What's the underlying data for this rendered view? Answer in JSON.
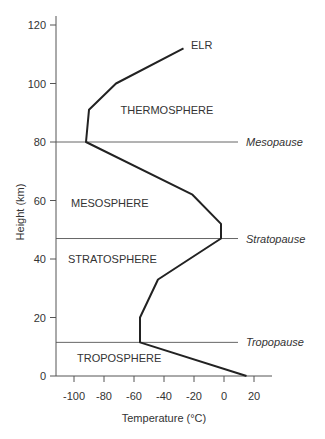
{
  "chart_data": {
    "type": "line",
    "title": "",
    "xlabel": "Temperature (°C)",
    "ylabel": "Height (km)",
    "xlim": [
      -115,
      32
    ],
    "ylim": [
      0,
      123
    ],
    "x_ticks": [
      -100,
      -80,
      -60,
      -40,
      -20,
      0,
      20
    ],
    "x_tick_labels": [
      "-100",
      "-80",
      "-60",
      "-40",
      "-20",
      "0",
      "20"
    ],
    "y_ticks": [
      0,
      20,
      40,
      60,
      80,
      100,
      120
    ],
    "y_tick_labels": [
      "0",
      "20",
      "40",
      "60",
      "80",
      "100",
      "120"
    ],
    "grid": false,
    "legend": null,
    "series": [
      {
        "name": "ELR",
        "points": [
          {
            "temperature": 15,
            "height": 0
          },
          {
            "temperature": -56,
            "height": 11.5
          },
          {
            "temperature": -56,
            "height": 20
          },
          {
            "temperature": -44,
            "height": 33
          },
          {
            "temperature": -2,
            "height": 47
          },
          {
            "temperature": -2,
            "height": 52
          },
          {
            "temperature": -21,
            "height": 62
          },
          {
            "temperature": -92,
            "height": 80
          },
          {
            "temperature": -90,
            "height": 91
          },
          {
            "temperature": -72,
            "height": 100
          },
          {
            "temperature": -27,
            "height": 112
          }
        ]
      }
    ],
    "boundaries": [
      {
        "name": "Tropopause",
        "height": 11.5
      },
      {
        "name": "Stratopause",
        "height": 47
      },
      {
        "name": "Mesopause",
        "height": 80
      }
    ],
    "layers": [
      {
        "name": "TROPOSPHERE",
        "label_temperature": -98,
        "label_height": 6
      },
      {
        "name": "STRATOSPHERE",
        "label_temperature": -104,
        "label_height": 40
      },
      {
        "name": "MESOSPHERE",
        "label_temperature": -102,
        "label_height": 59
      },
      {
        "name": "THERMOSPHERE",
        "label_temperature": -69,
        "label_height": 91
      }
    ],
    "annotations": [
      {
        "text": "ELR",
        "temperature": -22,
        "height": 113
      }
    ]
  }
}
